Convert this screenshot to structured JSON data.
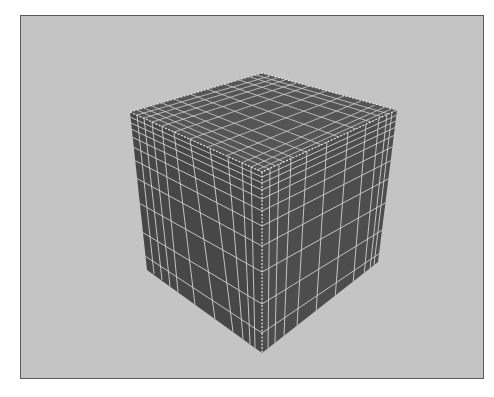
{
  "scene": {
    "subject": "subdivided cube wireframe",
    "background_color": "#c4c4c4",
    "cube_face_color": "#4a4a4a",
    "wire_color": "#d8d8d8",
    "frame_color": "#5a5a5a"
  }
}
